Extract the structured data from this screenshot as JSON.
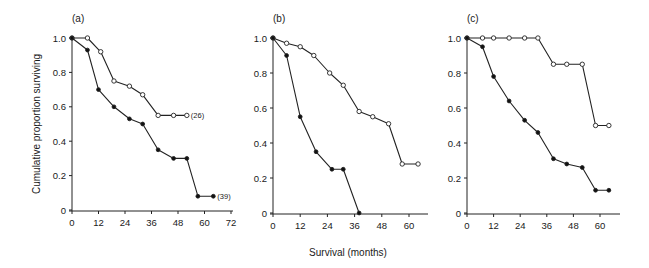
{
  "figure": {
    "ylabel": "Cumulative proportion surviving",
    "xlabel": "Survival (months)"
  },
  "chart_data": [
    {
      "type": "line",
      "panel_label": "(a)",
      "xlabel": "",
      "ylabel": "Cumulative proportion surviving",
      "xlim": [
        0,
        72
      ],
      "ylim": [
        0,
        1.0
      ],
      "xticks": [
        "0",
        "12",
        "24",
        "36",
        "48",
        "60",
        "72"
      ],
      "yticks": [
        "0",
        "0.2",
        "0.4",
        "0.6",
        "0.8",
        "1.0"
      ],
      "grid": false,
      "series": [
        {
          "name": "open",
          "marker": "open-circle",
          "end_annotation": "(26)",
          "x": [
            0,
            7,
            13,
            19,
            26,
            32,
            39,
            46,
            52
          ],
          "y": [
            1.0,
            1.0,
            0.92,
            0.75,
            0.72,
            0.67,
            0.55,
            0.55,
            0.55
          ]
        },
        {
          "name": "filled",
          "marker": "filled-circle",
          "end_annotation": "(39)",
          "x": [
            0,
            7,
            12,
            19,
            26,
            32,
            39,
            46,
            52,
            57,
            64
          ],
          "y": [
            1.0,
            0.93,
            0.7,
            0.6,
            0.53,
            0.5,
            0.35,
            0.3,
            0.3,
            0.08,
            0.08
          ]
        }
      ]
    },
    {
      "type": "line",
      "panel_label": "(b)",
      "xlabel": "Survival (months)",
      "ylabel": "",
      "xlim": [
        0,
        66
      ],
      "ylim": [
        0,
        1.0
      ],
      "xticks": [
        "0",
        "12",
        "24",
        "36",
        "48",
        "60"
      ],
      "yticks": [
        "0",
        "0.2",
        "0.4",
        "0.6",
        "0.8",
        "1.0"
      ],
      "grid": false,
      "series": [
        {
          "name": "open",
          "marker": "open-circle",
          "x": [
            0,
            6,
            12,
            18,
            25,
            31,
            38,
            44,
            51,
            57,
            64
          ],
          "y": [
            1.0,
            0.97,
            0.95,
            0.9,
            0.8,
            0.73,
            0.58,
            0.55,
            0.51,
            0.28,
            0.28
          ]
        },
        {
          "name": "filled",
          "marker": "filled-circle",
          "x": [
            0,
            6,
            12,
            19,
            26,
            31,
            38
          ],
          "y": [
            1.0,
            0.9,
            0.55,
            0.35,
            0.25,
            0.25,
            0.0
          ]
        }
      ]
    },
    {
      "type": "line",
      "panel_label": "(c)",
      "xlabel": "",
      "ylabel": "",
      "xlim": [
        0,
        66
      ],
      "ylim": [
        0,
        1.0
      ],
      "xticks": [
        "0",
        "12",
        "24",
        "36",
        "48",
        "60"
      ],
      "yticks": [
        "0",
        "0.2",
        "0.4",
        "0.6",
        "0.8",
        "1.0"
      ],
      "grid": false,
      "series": [
        {
          "name": "open",
          "marker": "open-circle",
          "x": [
            0,
            7,
            12,
            19,
            26,
            32,
            39,
            45,
            52,
            58,
            64
          ],
          "y": [
            1.0,
            1.0,
            1.0,
            1.0,
            1.0,
            1.0,
            0.85,
            0.85,
            0.85,
            0.5,
            0.5
          ]
        },
        {
          "name": "filled",
          "marker": "filled-circle",
          "x": [
            0,
            7,
            12,
            19,
            26,
            32,
            39,
            45,
            52,
            58,
            64
          ],
          "y": [
            1.0,
            0.95,
            0.78,
            0.64,
            0.53,
            0.46,
            0.31,
            0.28,
            0.26,
            0.13,
            0.13
          ]
        }
      ]
    }
  ]
}
